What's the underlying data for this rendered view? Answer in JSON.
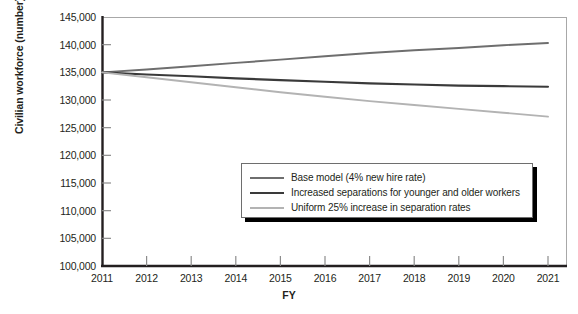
{
  "chart_data": {
    "type": "line",
    "title": "",
    "xlabel": "FY",
    "ylabel": "Civilian workforce (number)",
    "x": [
      2011,
      2012,
      2013,
      2014,
      2015,
      2016,
      2017,
      2018,
      2019,
      2020,
      2021
    ],
    "xtick_labels": [
      "2011",
      "2012",
      "2013",
      "2014",
      "2015",
      "2016",
      "2017",
      "2018",
      "2019",
      "2020",
      "2021"
    ],
    "ytick_labels": [
      "100,000",
      "105,000",
      "110,000",
      "115,000",
      "120,000",
      "125,000",
      "130,000",
      "135,000",
      "140,000",
      "145,000"
    ],
    "ytick_values": [
      100000,
      105000,
      110000,
      115000,
      120000,
      125000,
      130000,
      135000,
      140000,
      145000
    ],
    "ylim": [
      100000,
      145000
    ],
    "xlim": [
      2011,
      2021
    ],
    "grid": false,
    "legend_position": "center-right-inside",
    "series": [
      {
        "name": "Base model (4% new hire rate)",
        "color": "#6e6e6e",
        "width": 1.9,
        "values": [
          135000,
          135500,
          136100,
          136700,
          137300,
          137900,
          138500,
          139000,
          139400,
          139900,
          140300
        ]
      },
      {
        "name": "Increased separations for younger and older workers",
        "color": "#3a3a3a",
        "width": 2.1,
        "values": [
          135000,
          134600,
          134300,
          133900,
          133600,
          133300,
          133000,
          132800,
          132600,
          132500,
          132400
        ]
      },
      {
        "name": "Uniform 25% increase in separation rates",
        "color": "#b3b3b3",
        "width": 1.9,
        "values": [
          135000,
          134100,
          133200,
          132300,
          131400,
          130600,
          129800,
          129100,
          128400,
          127700,
          127000
        ]
      }
    ]
  },
  "legend": {
    "items": [
      {
        "label": "Base model (4% new hire rate)",
        "color": "#6e6e6e"
      },
      {
        "label": "Increased separations for younger and older workers",
        "color": "#3a3a3a"
      },
      {
        "label": "Uniform 25% increase in separation rates",
        "color": "#b3b3b3"
      }
    ]
  },
  "axes": {
    "frame_color": "#8c8c8c",
    "axis_color": "#231f20"
  }
}
